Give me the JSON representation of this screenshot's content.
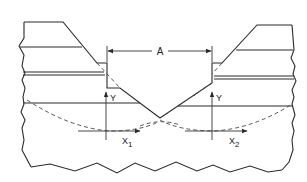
{
  "diagram": {
    "type": "cross-section engineering drawing",
    "labels": {
      "dimension": "A",
      "y_axis_left": "Y",
      "y_axis_right": "Y",
      "x_axis_left_main": "X",
      "x_axis_left_sub": "1",
      "x_axis_right_main": "X",
      "x_axis_right_sub": "2"
    },
    "colors": {
      "line": "#2a2a2a",
      "background": "#ffffff"
    }
  }
}
